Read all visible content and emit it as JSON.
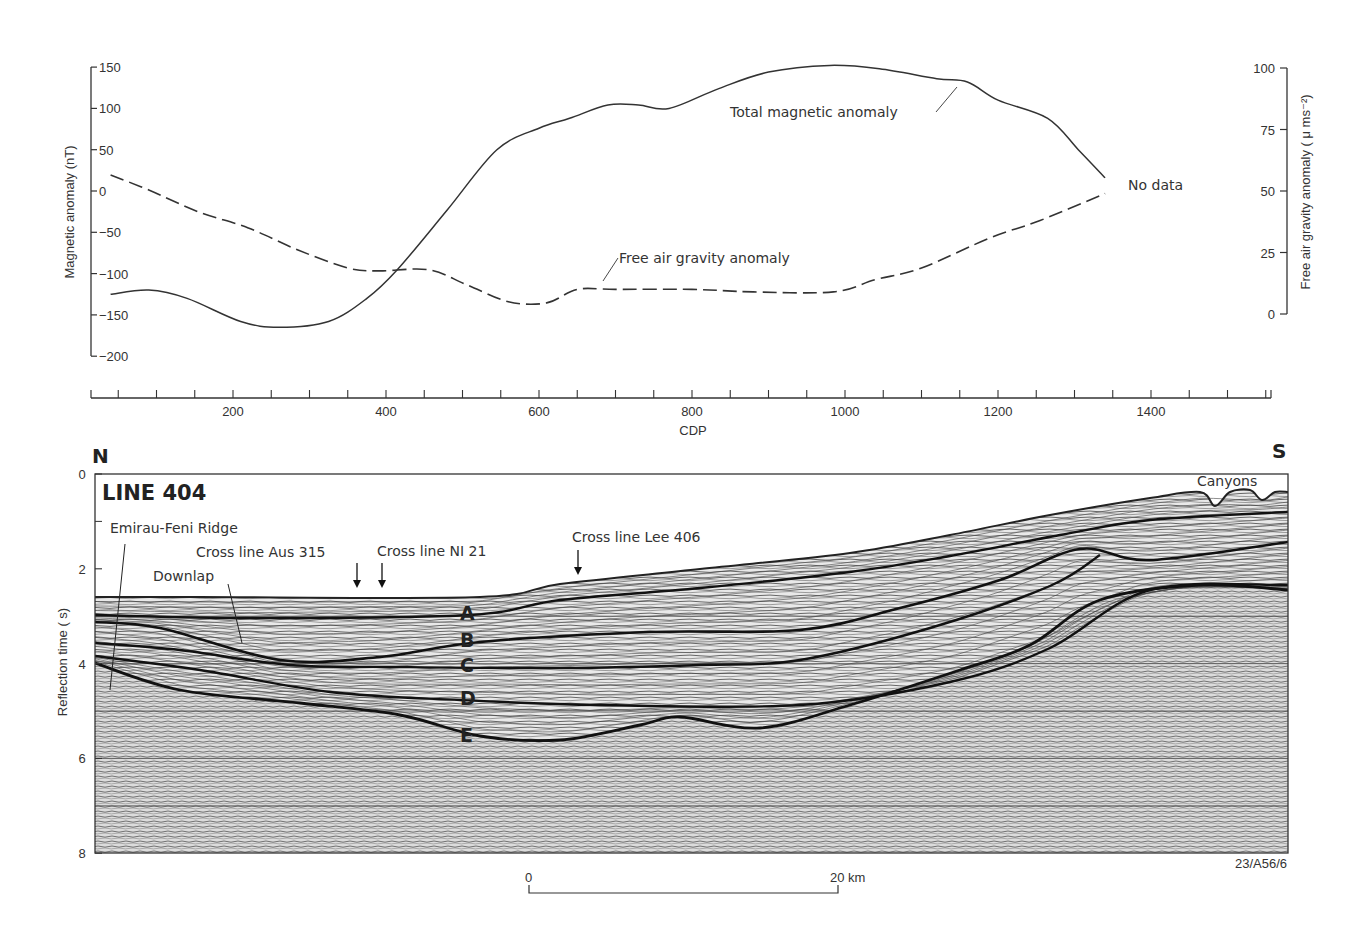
{
  "chart_data": [
    {
      "type": "line",
      "title": "Magnetic and free air gravity anomaly profiles along Line 404",
      "xlabel": "CDP",
      "x_ticks": [
        200,
        400,
        600,
        800,
        1000,
        1200,
        1400
      ],
      "xlim": [
        14,
        1555
      ],
      "y_left": {
        "label": "Magnetic anomaly (nT)",
        "ticks": [
          150,
          100,
          50,
          0,
          -50,
          -100,
          -150,
          -200
        ],
        "ylim": [
          -200,
          150
        ]
      },
      "y_right": {
        "label": "Free air gravity anomaly (μ ms⁻²)",
        "ticks": [
          100,
          75,
          50,
          25,
          0
        ],
        "ylim": [
          0,
          100
        ]
      },
      "grid": false,
      "series": [
        {
          "name": "Total magnetic anomaly",
          "axis": "left",
          "style": "solid",
          "x": [
            40,
            90,
            140,
            210,
            260,
            325,
            375,
            415,
            480,
            545,
            600,
            640,
            690,
            730,
            770,
            835,
            900,
            980,
            1045,
            1120,
            1160,
            1200,
            1265,
            1305,
            1340
          ],
          "y": [
            -125,
            -120,
            -130,
            -158,
            -165,
            -158,
            -130,
            -95,
            -23,
            50,
            76,
            88,
            104,
            104,
            100,
            124,
            144,
            152,
            148,
            136,
            132,
            110,
            88,
            50,
            16
          ]
        },
        {
          "name": "Free air gravity anomaly",
          "axis": "right",
          "style": "dashed",
          "x": [
            40,
            90,
            155,
            220,
            285,
            350,
            390,
            455,
            505,
            560,
            610,
            650,
            700,
            800,
            880,
            985,
            1040,
            1100,
            1190,
            1255,
            1340
          ],
          "y": [
            56.5,
            50.4,
            41.5,
            35,
            26,
            18.7,
            17.5,
            18,
            12,
            5,
            4.5,
            10,
            10,
            10,
            9,
            9,
            14,
            18.7,
            31,
            38,
            49
          ]
        }
      ],
      "annotations": [
        {
          "text": "Total magnetic anomaly"
        },
        {
          "text": "Free air gravity anomaly"
        },
        {
          "text": "No data"
        }
      ]
    },
    {
      "type": "image",
      "title": "LINE 404",
      "description": "Seismic reflection section",
      "ylabel": "Reflection time (s)",
      "y_ticks": [
        0,
        2,
        4,
        6,
        8
      ],
      "ylim": [
        8,
        0
      ],
      "orientation": {
        "left": "N",
        "right": "S"
      },
      "reflectors": [
        "A",
        "B",
        "C",
        "D",
        "E"
      ],
      "annotations": [
        "Emirau-Feni Ridge",
        "Downlap",
        "Cross line Aus 315",
        "Cross line NI 21",
        "Cross line Lee 406",
        "Canyons"
      ],
      "scale_bar": {
        "start": "0",
        "end": "20 km"
      },
      "figure_id": "23/A56/6"
    }
  ],
  "profile": {
    "left_axis": {
      "title": "Magnetic anomaly (nT)",
      "ticks": [
        "150",
        "100",
        "50",
        "0",
        "−50",
        "−100",
        "−150",
        "−200"
      ]
    },
    "right_axis": {
      "title": "Free air gravity anomaly ( μ ms⁻²)",
      "ticks": [
        "100",
        "75",
        "50",
        "25",
        "0"
      ]
    },
    "labels": {
      "magnetic": "Total magnetic anomaly",
      "gravity": "Free air gravity anomaly",
      "no_data": "No data"
    }
  },
  "cdp_axis": {
    "title": "CDP",
    "ticks": [
      "200",
      "400",
      "600",
      "800",
      "1000",
      "1200",
      "1400"
    ]
  },
  "section": {
    "north": "N",
    "south": "S",
    "title": "LINE 404",
    "y_title": "Reflection time ( s)",
    "y_ticks": [
      "0",
      "2",
      "4",
      "6",
      "8"
    ],
    "labels": {
      "ridge": "Emirau-Feni Ridge",
      "downlap": "Downlap",
      "aus315": "Cross line Aus 315",
      "ni21": "Cross line NI 21",
      "lee406": "Cross line Lee 406",
      "canyons": "Canyons"
    },
    "reflectors": [
      "A",
      "B",
      "C",
      "D",
      "E"
    ],
    "figure_id": "23/A56/6"
  },
  "scale_bar": {
    "start": "0",
    "end": "20 km"
  }
}
